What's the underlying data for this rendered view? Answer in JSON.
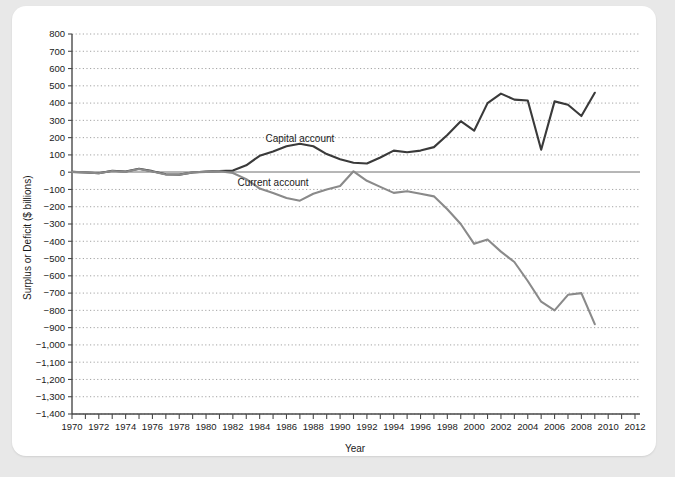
{
  "chart_data": {
    "type": "line",
    "title": "",
    "xlabel": "Year",
    "ylabel": "Surplus or Deficit ($ billions)",
    "xlim": [
      1970,
      2012
    ],
    "ylim": [
      -1400,
      800
    ],
    "ytick_step": 100,
    "xtick_step": 2,
    "grid": true,
    "grid_style": "dotted-horizontal",
    "legend_position": "inline-annotations",
    "x": [
      1970,
      1971,
      1972,
      1973,
      1974,
      1975,
      1976,
      1977,
      1978,
      1979,
      1980,
      1981,
      1982,
      1983,
      1984,
      1985,
      1986,
      1987,
      1988,
      1989,
      1990,
      1991,
      1992,
      1993,
      1994,
      1995,
      1996,
      1997,
      1998,
      1999,
      2000,
      2001,
      2002,
      2003,
      2004,
      2005,
      2006,
      2007,
      2008,
      2009
    ],
    "xticklabels": [
      "1970",
      "1972",
      "1974",
      "1976",
      "1978",
      "1980",
      "1982",
      "1984",
      "1986",
      "1988",
      "1990",
      "1992",
      "1994",
      "1996",
      "1998",
      "2000",
      "2002",
      "2004",
      "2006",
      "2008",
      "2010",
      "2012"
    ],
    "yticklabels": [
      "800",
      "700",
      "600",
      "500",
      "400",
      "300",
      "200",
      "100",
      "0",
      "−100",
      "−200",
      "−300",
      "−400",
      "−500",
      "−600",
      "−700",
      "−800",
      "−900",
      "−1,000",
      "−1,100",
      "−1,200",
      "−1,300",
      "−1,400"
    ],
    "series": [
      {
        "name": "Capital account",
        "color": "#3a3a3a",
        "label_x": 1987,
        "label_y": 175,
        "values": [
          2,
          -2,
          -6,
          8,
          4,
          20,
          6,
          -12,
          -14,
          -2,
          4,
          6,
          10,
          40,
          95,
          120,
          150,
          165,
          150,
          105,
          75,
          55,
          50,
          85,
          125,
          115,
          125,
          145,
          215,
          295,
          240,
          400,
          455,
          420,
          415,
          130,
          410,
          390,
          325,
          460
        ]
      },
      {
        "name": "Current account",
        "color": "#8a8a8a",
        "label_x": 1985,
        "label_y": -80,
        "values": [
          2,
          -1,
          -6,
          7,
          2,
          18,
          4,
          -14,
          -15,
          -1,
          2,
          5,
          -5,
          -40,
          -95,
          -120,
          -150,
          -165,
          -125,
          -100,
          -80,
          5,
          -50,
          -85,
          -120,
          -110,
          -125,
          -140,
          -215,
          -300,
          -415,
          -390,
          -460,
          -520,
          -630,
          -750,
          -800,
          -710,
          -700,
          -880
        ]
      }
    ]
  },
  "axis": {
    "y_title": "Surplus or Deficit ($ billions)",
    "x_title": "Year"
  }
}
